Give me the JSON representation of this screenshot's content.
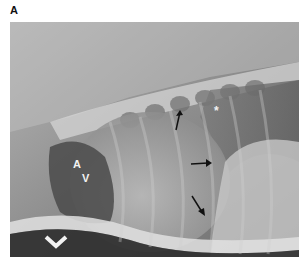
{
  "figure": {
    "panel_label": "A",
    "image_type": "lateral thoracic radiograph",
    "annotations": {
      "letter_a": "A",
      "letter_v": "V",
      "asterisk": "*"
    },
    "arrows": [
      {
        "name": "arrow-upper",
        "x": 175,
        "y": 120,
        "direction": "up"
      },
      {
        "name": "arrow-middle",
        "x": 200,
        "y": 163,
        "direction": "right"
      },
      {
        "name": "arrow-lower",
        "x": 198,
        "y": 210,
        "direction": "down-right"
      }
    ],
    "chevron": {
      "x": 57,
      "y": 242
    }
  }
}
